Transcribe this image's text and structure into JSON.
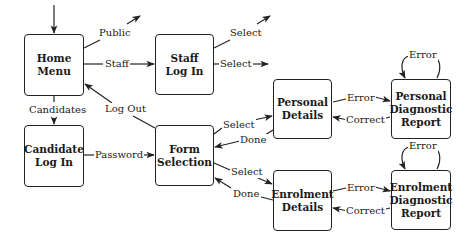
{
  "nodes": {
    "home_menu": {
      "line1": "Home",
      "line2": "Menu"
    },
    "candidate_login": {
      "line1": "Candidate",
      "line2": "Log In"
    },
    "staff_login": {
      "line1": "Staff",
      "line2": "Log In"
    },
    "form_selection": {
      "line1": "Form",
      "line2": "Selection"
    },
    "personal_details": {
      "line1": "Personal",
      "line2": "Details"
    },
    "enrolment_details": {
      "line1": "Enrolment",
      "line2": "Details"
    },
    "personal_diagnostic": {
      "line1": "Personal",
      "line2": "Diagnostic",
      "line3": "Report"
    },
    "enrolment_diagnostic": {
      "line1": "Enrolment",
      "line2": "Diagnostic",
      "line3": "Report"
    }
  },
  "edges": {
    "public": "Public",
    "staff": "Staff",
    "candidates": "Candidates",
    "log_out": "Log Out",
    "password": "Password",
    "staff_select_up": "Select",
    "staff_select_right": "Select",
    "select_personal": "Select",
    "done_personal": "Done",
    "select_enrolment": "Select",
    "done_enrolment": "Done",
    "personal_error": "Error",
    "personal_correct": "Correct",
    "personal_self_error": "Error",
    "enrolment_error": "Error",
    "enrolment_correct": "Correct",
    "enrolment_self_error": "Error"
  },
  "colors": {
    "stroke": "#222222",
    "background": "#ffffff"
  }
}
